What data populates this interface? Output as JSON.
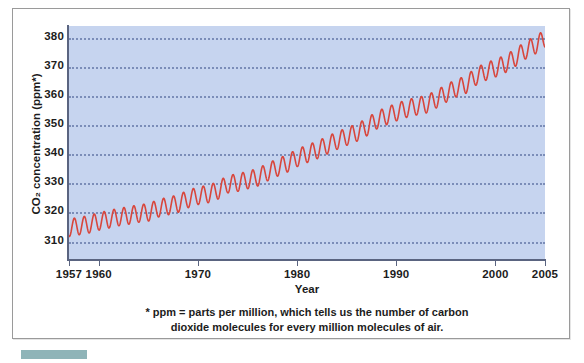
{
  "chart_data": {
    "type": "line",
    "title": "",
    "xlabel": "Year",
    "ylabel": "CO2 concentration (ppm*)",
    "ylabel_display": "CO₂ concentration (ppm*)",
    "xlim": [
      1957,
      2005
    ],
    "ylim": [
      304,
      384
    ],
    "grid": true,
    "grid_style": "dotted-horizontal",
    "legend": "none",
    "line_color": "#d8463c",
    "plot_background": "#c6d4ef",
    "axis_color": "#5a6480",
    "gridline_color": "#7b8db8",
    "x_ticks": [
      1957,
      1960,
      1970,
      1980,
      1990,
      2000,
      2005
    ],
    "x_tick_labels": [
      "1957",
      "1960",
      "1970",
      "1980",
      "1990",
      "2000",
      "2005"
    ],
    "y_ticks": [
      310,
      320,
      330,
      340,
      350,
      360,
      370,
      380
    ],
    "y_tick_labels": [
      "310",
      "320",
      "330",
      "340",
      "350",
      "360",
      "370",
      "380"
    ],
    "series": [
      {
        "name": "Atmospheric CO2 concentration (Mauna Loa)",
        "description": "Monthly mean CO2 with seasonal oscillation superimposed on a rising trend",
        "seasonal_amplitude_ppm": 3.0,
        "x": [
          1958,
          1959,
          1960,
          1961,
          1962,
          1963,
          1964,
          1965,
          1966,
          1967,
          1968,
          1969,
          1970,
          1971,
          1972,
          1973,
          1974,
          1975,
          1976,
          1977,
          1978,
          1979,
          1980,
          1981,
          1982,
          1983,
          1984,
          1985,
          1986,
          1987,
          1988,
          1989,
          1990,
          1991,
          1992,
          1993,
          1994,
          1995,
          1996,
          1997,
          1998,
          1999,
          2000,
          2001,
          2002,
          2003,
          2004,
          2005
        ],
        "annual_mean": [
          315.3,
          315.9,
          316.9,
          317.6,
          318.4,
          318.9,
          319.6,
          320.0,
          321.4,
          322.2,
          323.0,
          324.6,
          325.7,
          326.3,
          327.5,
          329.7,
          330.2,
          331.1,
          332.0,
          333.8,
          335.4,
          336.8,
          338.7,
          340.1,
          341.4,
          343.0,
          344.6,
          346.0,
          347.4,
          349.2,
          351.6,
          353.1,
          354.4,
          355.6,
          356.4,
          357.1,
          358.8,
          360.8,
          362.6,
          363.8,
          366.6,
          368.3,
          369.5,
          371.0,
          373.1,
          375.6,
          377.4,
          379.7
        ]
      }
    ],
    "footnote_line1": "* ppm = parts per million, which tells us the number of carbon",
    "footnote_line2": "dioxide molecules for every million molecules of air."
  },
  "axes": {
    "y_title": "CO₂ concentration (ppm*)",
    "x_title": "Year"
  },
  "footnote": {
    "line1": "* ppm = parts per million, which tells us the number of carbon",
    "line2": "dioxide molecules for every million molecules of air."
  }
}
